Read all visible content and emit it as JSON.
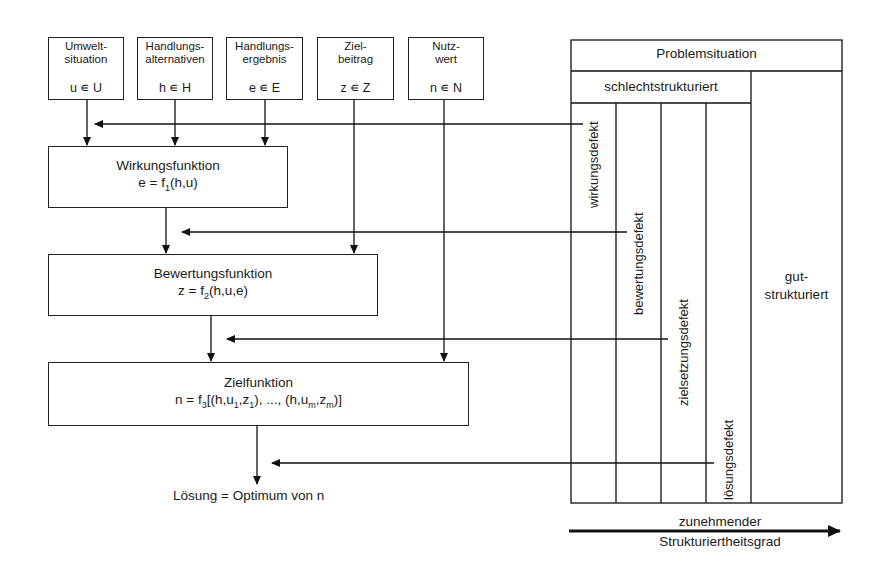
{
  "inputs": [
    {
      "title": "Umwelt-\nsituation",
      "line1": "Umwelt-",
      "line2": "situation",
      "var": "u ∊ U"
    },
    {
      "line1": "Handlungs-",
      "line2": "alternativen",
      "var": "h ∊ H"
    },
    {
      "line1": "Handlungs-",
      "line2": "ergebnis",
      "var": "e ∊ E"
    },
    {
      "line1": "Ziel-",
      "line2": "beitrag",
      "var": "z ∊ Z"
    },
    {
      "line1": "Nutz-",
      "line2": "wert",
      "var": "n ∊ N"
    }
  ],
  "functions": {
    "wirkung": {
      "name": "Wirkungsfunktion",
      "formula_prefix": "e = f",
      "formula_sub": "1",
      "formula_suffix": "(h,u)"
    },
    "bewertung": {
      "name": "Bewertungsfunktion",
      "formula_prefix": "z = f",
      "formula_sub": "2",
      "formula_suffix": "(h,u,e)"
    },
    "ziel": {
      "name": "Zielfunktion",
      "p1": "n = f",
      "s1": "3",
      "p2": "[(h,u",
      "s2": "1",
      "p3": ",z",
      "s3": "1",
      "p4": "), ..., (h,u",
      "s4": "m",
      "p5": ",z",
      "s5": "m",
      "p6": ")]"
    }
  },
  "solution": "Lösung = Optimum von n",
  "table": {
    "header": "Problemsituation",
    "ill_structured": "schlechtstrukturiert",
    "defects": [
      "wirkungsdefekt",
      "bewertungsdefekt",
      "zielsetzungsdefekt",
      "lösungsdefekt"
    ],
    "well_structured_line1": "gut-",
    "well_structured_line2": "strukturiert"
  },
  "axis": {
    "line1": "zunehmender",
    "line2": "Strukturiertheitsgrad"
  }
}
